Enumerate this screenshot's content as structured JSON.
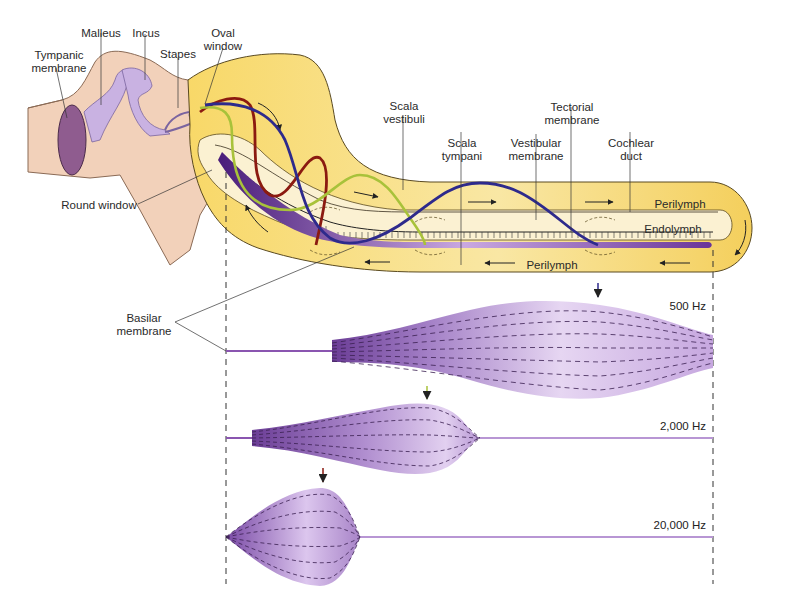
{
  "diagram": {
    "type": "anatomy"
  },
  "labels": {
    "tympanic_membrane": [
      "Tympanic",
      "membrane"
    ],
    "malleus": [
      "Malleus"
    ],
    "incus": [
      "Incus"
    ],
    "stapes": [
      "Stapes"
    ],
    "oval_window": [
      "Oval",
      "window"
    ],
    "round_window": [
      "Round window"
    ],
    "scala_vestibuli": [
      "Scala",
      "vestibuli"
    ],
    "scala_tympani": [
      "Scala",
      "tympani"
    ],
    "vestibular_membrane": [
      "Vestibular",
      "membrane"
    ],
    "tectorial_membrane": [
      "Tectorial",
      "membrane"
    ],
    "cochlear_duct": [
      "Cochlear",
      "duct"
    ],
    "perilymph_top": "Perilymph",
    "endolymph": "Endolymph",
    "perilymph_bottom": "Perilymph",
    "basilar_membrane": [
      "Basilar",
      "membrane"
    ]
  },
  "frequencies": [
    {
      "label": "500 Hz",
      "color": "#2e2a8c",
      "peak_position": "far from base (near apex)"
    },
    {
      "label": "2,000 Hz",
      "color": "#a8c23a",
      "peak_position": "middle"
    },
    {
      "label": "20,000 Hz",
      "color": "#8b1a10",
      "peak_position": "near base"
    }
  ],
  "colors": {
    "cochlea_fill": "#f7d66a",
    "cochlea_inner": "#fbf0cf",
    "middle_ear": "#f3d2bc",
    "ossicles": "#c7b0e0",
    "basilar": "#8a55b0",
    "wave_500": "#2e2a8c",
    "wave_2000": "#a8c23a",
    "wave_20000": "#8b1a10"
  }
}
